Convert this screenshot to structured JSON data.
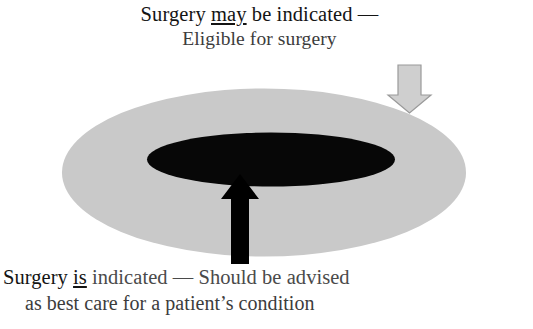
{
  "diagram": {
    "colors": {
      "background": "#ffffff",
      "outer_zone_fill": "#c9c9c9",
      "inner_zone_fill": "#070707",
      "solid_arrow_fill": "#000000",
      "hollow_arrow_fill": "#cfcfcf",
      "hollow_arrow_stroke": "#9a9a9a",
      "text_primary": "#141414",
      "text_secondary": "#3c3c3c"
    },
    "zones": [
      {
        "name": "outer-zone",
        "label": "Eligible for surgery",
        "fill": "#c9c9c9"
      },
      {
        "name": "inner-zone",
        "label": "Should be advised as best care for a patient's condition",
        "fill": "#070707"
      }
    ],
    "callouts": {
      "top": {
        "line_1_before": "Surgery ",
        "line_1_emphasis": "may",
        "line_1_after": " be indicated —",
        "line_2": "Eligible for surgery",
        "arrow": "hollow-down-arrow",
        "points_to": "outer-zone"
      },
      "bottom": {
        "line_1_before": "Surgery ",
        "line_1_emphasis": "is",
        "line_1_after": " indicated — Should be advised",
        "line_2": "as best care for a patient’s condition",
        "arrow": "solid-up-arrow",
        "points_to": "inner-zone"
      }
    }
  }
}
